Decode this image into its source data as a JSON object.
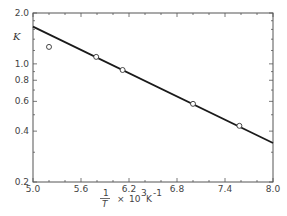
{
  "chart_data": {
    "type": "scatter",
    "title": "",
    "xlabel": "1/T × 10^3 K^-1",
    "xlabel_parts": {
      "frac_num": "1",
      "frac_den": "T",
      "times": "×",
      "base": "10",
      "exp": "3",
      "unit": "K",
      "unit_exp": "-1"
    },
    "ylabel": "K",
    "xlim": [
      5.0,
      8.0
    ],
    "ylim": [
      0.2,
      2.0
    ],
    "yscale": "log",
    "grid": false,
    "x_ticks": [
      "5.0",
      "5.6",
      "6.2",
      "6.8",
      "7.4",
      "8.0"
    ],
    "x_tick_values": [
      5.0,
      5.6,
      6.2,
      6.8,
      7.4,
      8.0
    ],
    "y_ticks": [
      "2.0",
      "1.0",
      "0.8",
      "0.6",
      "0.4",
      "0.2"
    ],
    "y_tick_values": [
      2.0,
      1.0,
      0.8,
      0.6,
      0.4,
      0.2
    ],
    "series": [
      {
        "name": "measured",
        "marker": "open-circle",
        "x": [
          5.2,
          5.79,
          6.12,
          7.0,
          7.58
        ],
        "y": [
          1.26,
          1.1,
          0.92,
          0.58,
          0.43
        ]
      },
      {
        "name": "fit",
        "style": "line",
        "x": [
          5.0,
          8.0
        ],
        "y": [
          1.66,
          0.34
        ]
      }
    ]
  },
  "colors": {
    "axis": "#555555",
    "line": "#1a1a1a",
    "marker": "#333333"
  }
}
